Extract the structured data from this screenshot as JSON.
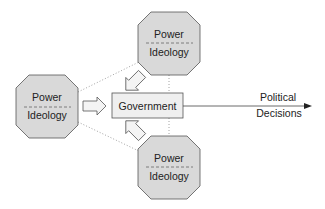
{
  "diagram": {
    "nodes": {
      "left": {
        "top_label": "Power",
        "bottom_label": "Ideology"
      },
      "top": {
        "top_label": "Power",
        "bottom_label": "Ideology"
      },
      "bottom": {
        "top_label": "Power",
        "bottom_label": "Ideology"
      },
      "center": {
        "label": "Government"
      }
    },
    "output": {
      "line1": "Political",
      "line2": "Decisions"
    },
    "colors": {
      "octagon_fill": "#d9d9d9",
      "box_fill": "#efefef",
      "stroke": "#555555"
    }
  }
}
